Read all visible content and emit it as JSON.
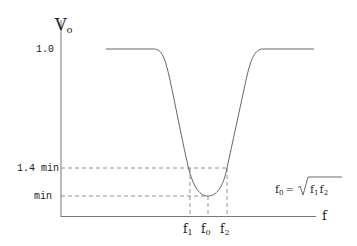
{
  "diagram": {
    "y_axis_label": "V",
    "y_axis_sub": "o",
    "x_axis_label": "f",
    "y_ticks": [
      {
        "label": "1.0",
        "y": 49
      },
      {
        "label": "1.4 min",
        "y": 168
      },
      {
        "label": "min",
        "y": 196
      }
    ],
    "x_ticks": [
      {
        "label": "f",
        "sub": "1",
        "x": 190
      },
      {
        "label": "f",
        "sub": "0",
        "x": 208
      },
      {
        "label": "f",
        "sub": "2",
        "x": 227
      }
    ],
    "formula": {
      "lhs": "f",
      "lhs_sub": "0",
      "eq": "=",
      "rhs_a": "f",
      "rhs_a_sub": "1",
      "rhs_b": "f",
      "rhs_b_sub": "2"
    },
    "colors": {
      "line": "#555555",
      "dash": "#666666"
    }
  }
}
